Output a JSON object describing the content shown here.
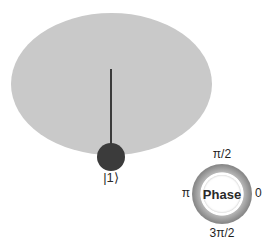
{
  "figure": {
    "type": "bloch-disc-with-phase-dial",
    "background_color": "#ffffff"
  },
  "disc": {
    "name": "bloch-disc",
    "fill_color": "#c9c9c9"
  },
  "state_vector": {
    "label": "|1⟩",
    "stem_color": "#3a3a3a",
    "dot_color": "#3b3b3b",
    "direction": "down",
    "pole": "south"
  },
  "phase_dial": {
    "center_label": "Phase",
    "ring_color": "#8a8a8a",
    "hole_color": "#ffffff",
    "ticks": {
      "top": "π/2",
      "right": "0",
      "bottom": "3π/2",
      "left": "π"
    }
  }
}
